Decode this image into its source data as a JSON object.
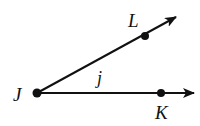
{
  "diagram": {
    "type": "geometry-angle",
    "colors": {
      "stroke": "#111111",
      "background": "#ffffff"
    },
    "vertex": {
      "label": "J",
      "x": 37,
      "y": 93
    },
    "rays": [
      {
        "name": "ray-JL",
        "from": "J",
        "through": "L",
        "tip": {
          "x": 176,
          "y": 17
        }
      },
      {
        "name": "ray-JK",
        "from": "J",
        "through": "K",
        "tip": {
          "x": 194,
          "y": 93
        }
      }
    ],
    "points": [
      {
        "label": "J",
        "x": 37,
        "y": 93
      },
      {
        "label": "L",
        "x": 145,
        "y": 36
      },
      {
        "label": "K",
        "x": 161,
        "y": 93
      }
    ],
    "labels": {
      "J": "J",
      "L": "L",
      "K": "K",
      "angle": "j"
    }
  }
}
